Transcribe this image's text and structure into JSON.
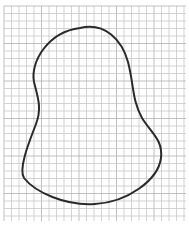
{
  "figure": {
    "type": "freehand-closed-curve-on-grid",
    "grid": {
      "spacing_px": 7.5,
      "line_color": "#c8c8c8",
      "major_line_color": "#b0b0b0",
      "left": 4,
      "top": 6,
      "right": 186,
      "bottom": 221
    },
    "curve": {
      "stroke_color": "#2a2a2a",
      "stroke_width": 2,
      "path": "M 80 28 C 105 22, 122 40, 128 62 C 134 85, 132 100, 142 118 C 152 134, 163 140, 161 158 C 158 180, 128 202, 95 204 C 65 206, 35 192, 24 178 C 18 168, 30 140, 36 124 C 42 108, 38 98, 34 82 C 30 62, 48 32, 80 28 Z"
    }
  }
}
